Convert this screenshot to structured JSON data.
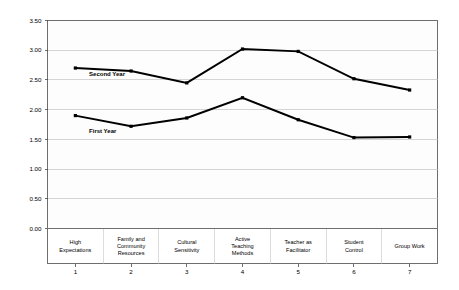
{
  "chart_data": {
    "type": "line",
    "title": "",
    "subtitle": "",
    "xlabel": "",
    "ylabel": "",
    "ylim": [
      0.0,
      3.5
    ],
    "ytick_labels": [
      "0.00",
      "0.50",
      "1.00",
      "1.50",
      "2.00",
      "2.50",
      "3.00",
      "3.50"
    ],
    "ytick_values": [
      0.0,
      0.5,
      1.0,
      1.5,
      2.0,
      2.5,
      3.0,
      3.5
    ],
    "grid": true,
    "legend_position": "inline-on-plot",
    "x": [
      1,
      2,
      3,
      4,
      5,
      6,
      7
    ],
    "xtick_numbers": [
      "1",
      "2",
      "3",
      "4",
      "5",
      "6",
      "7"
    ],
    "categories": [
      "High Expectations",
      "Family and Community Resources",
      "Cultural Sensitivity",
      "Active Teaching Methods",
      "Teacher as Facilitator",
      "Student Control",
      "Group Work"
    ],
    "category_lines": [
      [
        "High",
        "Expectations"
      ],
      [
        "Family and",
        "Community",
        "Resources"
      ],
      [
        "Cultural",
        "Sensitivity"
      ],
      [
        "Active",
        "Teaching",
        "Methods"
      ],
      [
        "Teacher as",
        "Facilitator"
      ],
      [
        "Student",
        "Control"
      ],
      [
        "Group Work"
      ]
    ],
    "series": [
      {
        "name": "Second Year",
        "color": "#000000",
        "values": [
          2.7,
          2.65,
          2.45,
          3.02,
          2.98,
          2.52,
          2.33
        ],
        "label_anchor_index": 1,
        "label_value": 2.57
      },
      {
        "name": "First Year",
        "color": "#000000",
        "values": [
          1.9,
          1.72,
          1.86,
          2.2,
          1.83,
          1.53,
          1.54
        ],
        "label_anchor_index": 1,
        "label_value": 1.6
      }
    ]
  },
  "colors": {
    "series_line": "#000000",
    "gridline": "#b9b9b9",
    "axis_border": "#6e6e6e",
    "plot_background": "#fdfdfd",
    "page_background": "#ffffff",
    "text": "#000000"
  }
}
